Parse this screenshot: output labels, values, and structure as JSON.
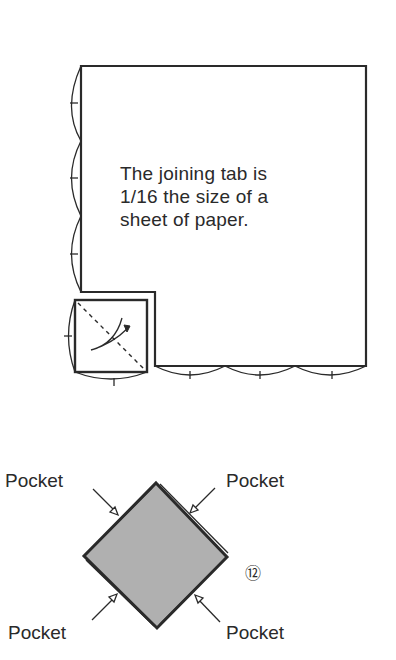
{
  "diagram": {
    "note_lines": [
      "The joining tab is",
      "1/16 the size of a",
      "sheet of paper."
    ],
    "pocket_labels": {
      "top_left": "Pocket",
      "top_right": "Pocket",
      "bottom_left": "Pocket",
      "bottom_right": "Pocket"
    },
    "step_number": "⑫",
    "colors": {
      "line": "#2a2a2a",
      "fill_gray": "#a9a9a9",
      "background": "#ffffff"
    }
  }
}
